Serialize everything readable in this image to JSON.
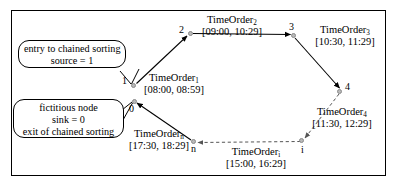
{
  "figure": {
    "border_color": "#000000",
    "background": "#ffffff"
  },
  "callouts": [
    {
      "id": "entry",
      "lines": [
        "entry to chained sorting",
        "source = 1"
      ],
      "line1": "entry to chained sorting",
      "line2": "source = 1"
    },
    {
      "id": "exit",
      "lines": [
        "fictitious node",
        "sink = 0",
        "exit of chained sorting"
      ],
      "line1": "fictitious node",
      "line2": "sink = 0",
      "line3": "exit of chained sorting"
    }
  ],
  "nodes": [
    {
      "id": "1",
      "label": "1",
      "x": 133,
      "y": 85
    },
    {
      "id": "0",
      "label": "0",
      "x": 134,
      "y": 101
    },
    {
      "id": "2",
      "label": "2",
      "x": 190,
      "y": 33
    },
    {
      "id": "3",
      "label": "3",
      "x": 293,
      "y": 35
    },
    {
      "id": "4",
      "label": "4",
      "x": 341,
      "y": 91
    },
    {
      "id": "i",
      "label": "i",
      "x": 303,
      "y": 141
    },
    {
      "id": "n",
      "label": "n",
      "x": 194,
      "y": 143
    }
  ],
  "edge_labels": [
    {
      "id": "t1",
      "name": "TimeOrder",
      "sub": "1",
      "interval": "[08:00, 08:59]"
    },
    {
      "id": "t2",
      "name": "TimeOrder",
      "sub": "2",
      "interval": "[09:00, 10:29]"
    },
    {
      "id": "t3",
      "name": "TimeOrder",
      "sub": "3",
      "interval": "[10:30, 11:29]"
    },
    {
      "id": "t4",
      "name": "TimeOrder",
      "sub": "4",
      "interval": "[11:30, 12:29]"
    },
    {
      "id": "ti",
      "name": "TimeOrder",
      "sub": "i",
      "interval": "[15:00, 16:29]"
    },
    {
      "id": "tn",
      "name": "TimeOrder",
      "sub": "n",
      "interval": "[17:30, 18:29]"
    }
  ]
}
